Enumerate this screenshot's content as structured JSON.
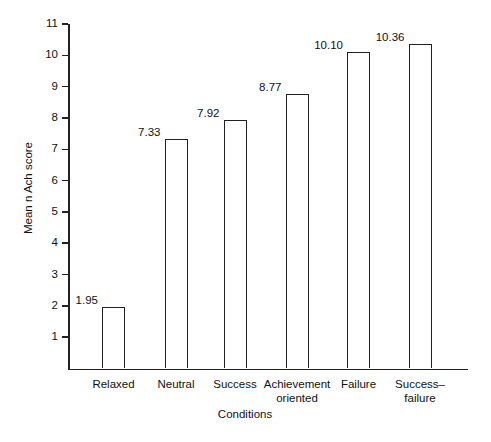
{
  "chart_data": {
    "type": "bar",
    "title": "",
    "categories": [
      "Relaxed",
      "Neutral",
      "Success",
      "Achievement\noriented",
      "Failure",
      "Success–\nfailure"
    ],
    "values": [
      1.95,
      7.33,
      7.92,
      8.77,
      10.1,
      10.36
    ],
    "value_labels": [
      "1.95",
      "7.33",
      "7.92",
      "8.77",
      "10.10",
      "10.36"
    ],
    "xlabel": "Conditions",
    "ylabel": "Mean n Ach score",
    "ylim": [
      0,
      11
    ],
    "ytick_labels": [
      "1",
      "2",
      "3",
      "4",
      "5",
      "6",
      "7",
      "8",
      "9",
      "10",
      "11"
    ],
    "yticks": [
      1,
      2,
      3,
      4,
      5,
      6,
      7,
      8,
      9,
      10,
      11
    ],
    "grid": false,
    "legend": "none",
    "bar_fill_color": "#ffffff",
    "bar_edge_color": "#222222",
    "background_color": "#ffffff"
  }
}
